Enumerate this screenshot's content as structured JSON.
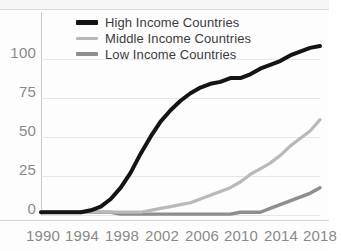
{
  "chart_data": {
    "type": "line",
    "title": "",
    "xlabel": "",
    "ylabel": "",
    "xlim": [
      1990,
      2018
    ],
    "ylim": [
      -3,
      105
    ],
    "yticks": [
      "0",
      "25",
      "50",
      "75",
      "100"
    ],
    "ytick_values": [
      0,
      25,
      50,
      75,
      100
    ],
    "xticks": [
      "1990",
      "1994",
      "1998",
      "2002",
      "2006",
      "2010",
      "2014",
      "2018"
    ],
    "xtick_values": [
      1990,
      1994,
      1998,
      2002,
      2006,
      2010,
      2014,
      2018
    ],
    "grid": "horizontal",
    "legend_position": "top-center",
    "x": [
      1990,
      1991,
      1992,
      1993,
      1994,
      1995,
      1996,
      1997,
      1998,
      1999,
      2000,
      2001,
      2002,
      2003,
      2004,
      2005,
      2006,
      2007,
      2008,
      2009,
      2010,
      2011,
      2012,
      2013,
      2014,
      2015,
      2016,
      2017,
      2018
    ],
    "series": [
      {
        "name": "High Income Countries",
        "color": "#141414",
        "values": [
          -1,
          -1,
          -1,
          -1,
          -1,
          0,
          2,
          6,
          12,
          20,
          30,
          39,
          47,
          53,
          58,
          62,
          65,
          67,
          68,
          70,
          70,
          72,
          75,
          77,
          79,
          82,
          84,
          86,
          87
        ]
      },
      {
        "name": "Middle Income Countries",
        "color": "#b9b9b9",
        "values": [
          -1,
          -1,
          -1,
          -1,
          -1,
          -1,
          -1,
          -1,
          -1,
          -1,
          -1,
          0,
          1,
          2,
          3,
          4,
          6,
          8,
          10,
          12,
          15,
          19,
          22,
          25,
          29,
          34,
          38,
          42,
          48
        ]
      },
      {
        "name": "Low Income Countries",
        "color": "#8e8e8e",
        "values": [
          -1,
          -1,
          -1,
          -1,
          -1,
          -1,
          -1,
          -1,
          -2,
          -2,
          -2,
          -2,
          -2,
          -2,
          -2,
          -2,
          -2,
          -2,
          -2,
          -2,
          -1,
          -1,
          -1,
          1,
          3,
          5,
          7,
          9,
          12
        ]
      }
    ],
    "colors": {
      "high_income": "#141414",
      "middle_income": "#b9b9b9",
      "low_income": "#8e8e8e",
      "gridline": "#e6e6e6",
      "axis": "#c9c9c9",
      "tick_label": "#8a8a8a",
      "legend_label": "#3c3c3c",
      "background": "#fdfdfd"
    }
  },
  "legend": {
    "items": [
      {
        "label": "High Income Countries"
      },
      {
        "label": "Middle Income Countries"
      },
      {
        "label": "Low Income Countries"
      }
    ]
  }
}
